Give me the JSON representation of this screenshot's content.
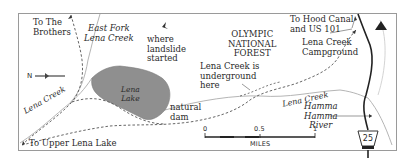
{
  "map": {
    "labels": {
      "to_the_brothers": [
        "To The",
        "Brothers"
      ],
      "east_fork": [
        "East Fork",
        "Lena Creek"
      ],
      "landslide": [
        "where",
        "landslide",
        "started"
      ],
      "forest": [
        "OLYMPIC",
        "NATIONAL",
        "FOREST"
      ],
      "hood_canal": [
        "To Hood Canal",
        "and US 101"
      ],
      "campground": [
        "Lena Creek",
        "Campground"
      ],
      "underground": [
        "Lena Creek is",
        "underground",
        "here"
      ],
      "lena_lake": [
        "Lena",
        "Lake"
      ],
      "natural_dam": [
        "natural",
        "dam"
      ],
      "lena_creek_left": "Lena Creek",
      "lena_creek_right": "Lena Creek",
      "hamma_hamma": [
        "Hamma",
        "Hamma",
        "River"
      ],
      "to_upper_lena_lake": "To Upper Lena Lake"
    },
    "compass": {
      "direction": "N"
    },
    "scale": {
      "ticks": [
        "0",
        "0.5",
        "1"
      ],
      "unit": "MILES"
    },
    "road_shield": "25",
    "colors": {
      "lake": "#8f8f8f",
      "frame": "#9a9a9a",
      "creek": "#b5b5b5",
      "trail": "#555555",
      "road": "#222222",
      "text": "#2a2a2a"
    }
  }
}
